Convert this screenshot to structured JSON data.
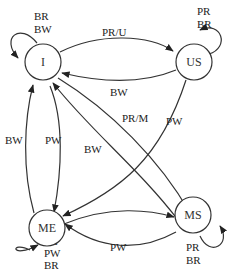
{
  "diagram": {
    "type": "state-transition",
    "nodes": [
      {
        "id": "I",
        "label": "I"
      },
      {
        "id": "US",
        "label": "US"
      },
      {
        "id": "ME",
        "label": "ME"
      },
      {
        "id": "MS",
        "label": "MS"
      }
    ],
    "self_loops": {
      "I": [
        "BR",
        "BW"
      ],
      "US": [
        "PR",
        "BR"
      ],
      "ME": [
        "PR",
        "PW",
        "BR"
      ],
      "MS": [
        "PR",
        "BR"
      ]
    },
    "edges": [
      {
        "from": "I",
        "to": "US",
        "label": "PR/U"
      },
      {
        "from": "US",
        "to": "I",
        "label": "BW"
      },
      {
        "from": "I",
        "to": "MS",
        "label": "PR/M"
      },
      {
        "from": "US",
        "to": "ME",
        "label": "PW"
      },
      {
        "from": "MS",
        "to": "I",
        "label": "BW"
      },
      {
        "from": "ME",
        "to": "I",
        "label": "BW"
      },
      {
        "from": "I",
        "to": "ME",
        "label": "PW"
      },
      {
        "from": "ME",
        "to": "MS",
        "label": ""
      },
      {
        "from": "MS",
        "to": "ME",
        "label": "PW"
      }
    ]
  }
}
